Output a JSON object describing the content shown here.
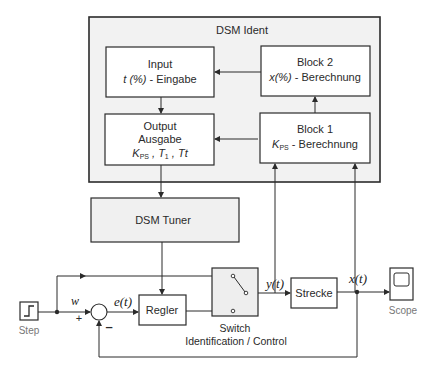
{
  "diagram": {
    "colors": {
      "line": "#2b2b2b",
      "group_fill": "#f2f2f2",
      "block_fill": "#ffffff",
      "tuner_fill": "#f0f0f0",
      "switch_fill": "#eeeeee",
      "caption_gray": "#777777"
    },
    "dsm_ident": {
      "title": "DSM Ident",
      "blocks": {
        "input": {
          "line1": "Input",
          "line2_italic": "t (%)",
          "line2_rest": " - Eingabe"
        },
        "block2": {
          "line1": "Block 2",
          "line2_italic": "x(%)",
          "line2_rest": " - Berechnung"
        },
        "output": {
          "line1": "Output",
          "line2": "Ausgabe",
          "line3": "K",
          "line3_sub": "PS",
          "line3_mid": " , T",
          "line3_sub2": "1",
          "line3_end": " , Tt"
        },
        "block1": {
          "line1": "Block 1",
          "line2_K": "K",
          "line2_sub": "PS",
          "line2_rest": " - Berechnung"
        }
      }
    },
    "dsm_tuner": {
      "label": "DSM Tuner"
    },
    "step": {
      "label": "Step",
      "icon": "step-icon"
    },
    "sum": {
      "plus": "+",
      "minus": "–"
    },
    "regler": {
      "label": "Regler"
    },
    "switch": {
      "label_line1": "Switch",
      "label_line2": "Identification / Control",
      "icon": "switch-icon"
    },
    "strecke": {
      "label": "Strecke"
    },
    "scope": {
      "label": "Scope",
      "icon": "scope-icon"
    },
    "signals": {
      "w": "w",
      "e": "e(t)",
      "y": "y(t)",
      "x": "x(t)"
    }
  }
}
